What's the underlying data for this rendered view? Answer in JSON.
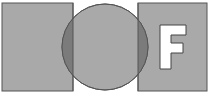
{
  "diagram": {
    "colors": {
      "fill": "#a9a9a9",
      "overlap": "#7b7b7b",
      "stroke": "#555555",
      "letter_fill": "#ffffff",
      "background": "#ffffff"
    },
    "left_square": {
      "x": 2,
      "y": 3,
      "width": 71,
      "height": 88
    },
    "circle": {
      "cx": 105,
      "cy": 47,
      "r": 43
    },
    "right_square": {
      "x": 138,
      "y": 3,
      "width": 69,
      "height": 88
    },
    "letter": {
      "text": "F"
    }
  }
}
